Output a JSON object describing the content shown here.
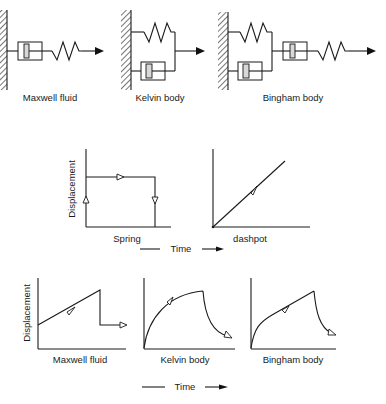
{
  "models": [
    {
      "id": "maxwell",
      "label": "Maxwell fluid",
      "components": [
        "wall",
        "dashpot",
        "spring",
        "arrow"
      ]
    },
    {
      "id": "kelvin",
      "label": "Kelvin body",
      "components": [
        "wall",
        "spring (parallel)",
        "dashpot (parallel)",
        "arrow"
      ]
    },
    {
      "id": "bingham",
      "label": "Bingham body",
      "components": [
        "wall",
        "spring (parallel)",
        "dashpot (parallel)",
        "dashpot",
        "spring",
        "arrow"
      ]
    }
  ],
  "element_graphs": {
    "y_label": "Displacement",
    "x_label": "Time",
    "graphs": [
      {
        "id": "spring",
        "label": "Spring",
        "shape": "step up, hold, drop to zero"
      },
      {
        "id": "dashpot",
        "label": "dashpot",
        "shape": "linear increase from origin"
      }
    ]
  },
  "model_graphs": {
    "y_label": "Displacement",
    "x_label": "Time",
    "graphs": [
      {
        "id": "maxwell",
        "label": "Maxwell fluid",
        "shape": "instant jump, linear rise, partial drop, hold"
      },
      {
        "id": "kelvin",
        "label": "Kelvin body",
        "shape": "exponential rise, exponential decay"
      },
      {
        "id": "bingham",
        "label": "Bingham body",
        "shape": "curved rise then linear, curved decay"
      }
    ]
  }
}
